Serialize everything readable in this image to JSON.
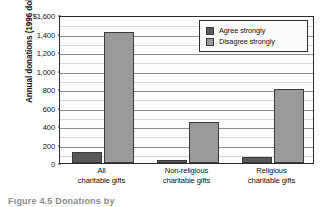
{
  "chart_data": {
    "type": "bar",
    "title": "",
    "subtitle": "",
    "xlabel": "",
    "ylabel": "Annual donations (1996 dollars)",
    "categories": [
      "All charitable gifts",
      "Non-religious charitable gifts",
      "Religious charitable gifts"
    ],
    "category_lines": [
      [
        "All",
        "charitable gifts"
      ],
      [
        "Non-religious",
        "charitable gifts"
      ],
      [
        "Religious",
        "charitable gifts"
      ]
    ],
    "series": [
      {
        "name": "Agree strongly",
        "color": "#595959",
        "values": [
          120,
          30,
          70
        ]
      },
      {
        "name": "Disagree strongly",
        "color": "#9a9a9a",
        "values": [
          1420,
          445,
          800
        ]
      }
    ],
    "ylim": [
      0,
      1600
    ],
    "ytick_values": [
      0,
      200,
      400,
      600,
      800,
      1000,
      1200,
      1400,
      1600
    ],
    "ytick_labels": [
      "0",
      "200",
      "400",
      "600",
      "800",
      "1,000",
      "1,200",
      "1,400",
      "$1,600"
    ],
    "grid": true,
    "grid_axis": "y",
    "legend_position": "upper right",
    "legend_entries": [
      "Agree strongly",
      "Disagree strongly"
    ],
    "frame": true
  },
  "caption": {
    "text": "Figure 4.5  Donations by"
  }
}
